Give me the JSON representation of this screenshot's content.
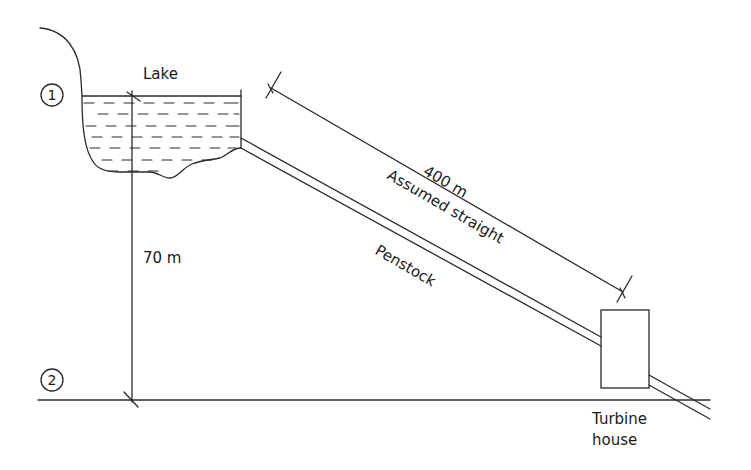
{
  "diagram": {
    "type": "hydro-penstock-schematic",
    "labels": {
      "lake": "Lake",
      "point1": "1",
      "point2": "2",
      "height": "70 m",
      "length": "400 m",
      "assumption": "Assumed straight",
      "penstock": "Penstock",
      "turbine_line1": "Turbine",
      "turbine_line2": "house"
    },
    "colors": {
      "stroke": "#2a2a2a",
      "text": "#1a1a1a",
      "background": "#ffffff"
    }
  }
}
